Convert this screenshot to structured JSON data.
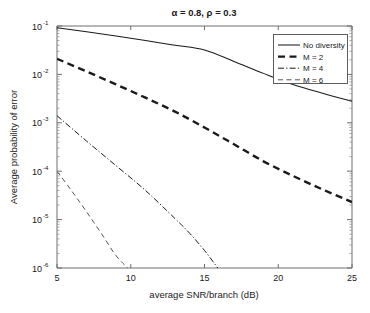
{
  "chart_data": {
    "type": "line",
    "title": "α = 0.8, ρ = 0.3",
    "xlabel": "average SNR/branch (dB)",
    "ylabel": "Average probability of error",
    "xlim": [
      5,
      25
    ],
    "ylim": [
      1e-06,
      0.1
    ],
    "yscale": "log",
    "xticks": [
      5,
      10,
      15,
      20,
      25
    ],
    "xtick_labels": [
      "5",
      "10",
      "15",
      "20",
      "25"
    ],
    "yticks": [
      0.1,
      0.01,
      0.001,
      0.0001,
      1e-05,
      1e-06
    ],
    "ytick_labels": [
      "10-1",
      "10-2",
      "10-3",
      "10-4",
      "10-5",
      "10-6"
    ],
    "ytick_mantissa": "10",
    "ytick_exponents": [
      "-1",
      "-2",
      "-3",
      "-4",
      "-5",
      "-6"
    ],
    "grid": false,
    "legend_position": "upper right",
    "series": [
      {
        "name": "No diversity",
        "style": "solid",
        "x": [
          5,
          7,
          9,
          11,
          13,
          15,
          17,
          19,
          21,
          23,
          25
        ],
        "y": [
          0.092,
          0.076,
          0.062,
          0.05,
          0.04,
          0.032,
          0.0185,
          0.0105,
          0.0062,
          0.0041,
          0.0028
        ]
      },
      {
        "name": "M = 2",
        "style": "dashed-bold",
        "x": [
          5,
          7,
          9,
          11,
          13,
          15,
          17,
          19,
          21,
          23,
          25
        ],
        "y": [
          0.021,
          0.0115,
          0.0062,
          0.0033,
          0.0017,
          0.0008,
          0.00036,
          0.00016,
          8e-05,
          4.2e-05,
          2.3e-05
        ]
      },
      {
        "name": "M = 4",
        "style": "dash-dot",
        "x": [
          5,
          7,
          9,
          11,
          13,
          14,
          15,
          15.9
        ],
        "y": [
          0.0014,
          0.00042,
          0.00013,
          4e-05,
          1.05e-05,
          5.2e-06,
          2.3e-06,
          1e-06
        ]
      },
      {
        "name": "M = 6",
        "style": "dashed-thin",
        "x": [
          5,
          6,
          7,
          8,
          9,
          9.8
        ],
        "y": [
          0.0001,
          3.9e-05,
          1.45e-05,
          5.2e-06,
          1.8e-06,
          1e-06
        ]
      }
    ],
    "legend_entries": [
      {
        "label": "No diversity",
        "style": "solid"
      },
      {
        "label": "M = 2",
        "style": "dashed-bold"
      },
      {
        "label": "M = 4",
        "style": "dash-dot"
      },
      {
        "label": "M = 6",
        "style": "dashed-thin"
      }
    ]
  }
}
